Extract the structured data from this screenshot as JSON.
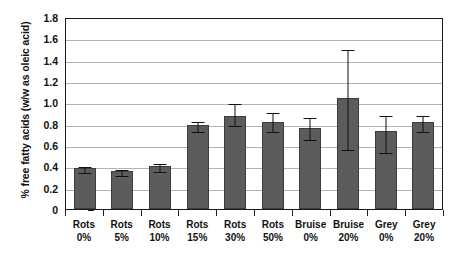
{
  "chart_data": {
    "type": "bar",
    "title": "",
    "xlabel": "",
    "ylabel": "% free fatty acids (w/w as oleic acid)",
    "ylim": [
      0,
      1.8
    ],
    "ytick_labels": [
      "1.8",
      "1.6",
      "1.4",
      "1.2",
      "1.0",
      "0.8",
      "0.6",
      "0.4",
      "0.2",
      "0"
    ],
    "ytick_values": [
      1.8,
      1.6,
      1.4,
      1.2,
      1.0,
      0.8,
      0.6,
      0.4,
      0.2,
      0
    ],
    "grid": "horizontal",
    "legend": "none",
    "bar_color": "#5c5c5c",
    "categories": [
      {
        "line1": "Rots",
        "line2": "0%"
      },
      {
        "line1": "Rots",
        "line2": "5%"
      },
      {
        "line1": "Rots",
        "line2": "10%"
      },
      {
        "line1": "Rots",
        "line2": "15%"
      },
      {
        "line1": "Rots",
        "line2": "30%"
      },
      {
        "line1": "Rots",
        "line2": "50%"
      },
      {
        "line1": "Bruise",
        "line2": "0%"
      },
      {
        "line1": "Bruise",
        "line2": "20%"
      },
      {
        "line1": "Grey",
        "line2": "0%"
      },
      {
        "line1": "Grey",
        "line2": "20%"
      }
    ],
    "values": [
      0.38,
      0.355,
      0.4,
      0.785,
      0.87,
      0.82,
      0.755,
      1.04,
      0.73,
      0.815
    ],
    "error_upper": [
      0.415,
      0.385,
      0.445,
      0.835,
      1.0,
      0.915,
      0.875,
      1.51,
      0.895,
      0.895
    ],
    "error_lower": [
      0.355,
      0.325,
      0.365,
      0.745,
      0.795,
      0.745,
      0.665,
      0.575,
      0.545,
      0.745
    ]
  }
}
